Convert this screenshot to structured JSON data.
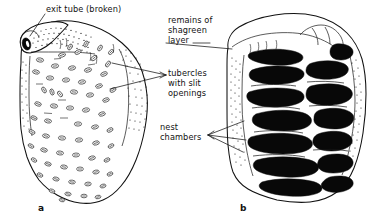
{
  "figure": {
    "background_color": "#ffffff",
    "ink_color": "#111111",
    "chamber_fill_color": "#080808"
  },
  "labels": {
    "exit_tube": "exit tube (broken)",
    "shagreen_line1": "remains of",
    "shagreen_line2": "shagreen",
    "shagreen_line3": "layer",
    "tubercles_line1": "tubercles",
    "tubercles_line2": "with slit",
    "tubercles_line3": "openings",
    "nest_line1": "nest",
    "nest_line2": "chambers"
  },
  "panels": {
    "a": {
      "caption": "a",
      "description": "exterior view of nest with tubercles and broken exit tube"
    },
    "b": {
      "caption": "b",
      "description": "cross-section of nest showing black nest chambers"
    }
  },
  "icons": {
    "leader_line": "leader-line",
    "exit_tube_opening": "exit-tube-opening-icon"
  }
}
